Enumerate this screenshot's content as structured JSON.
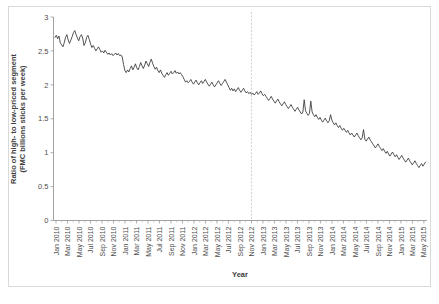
{
  "chart_data": {
    "type": "line",
    "title": "",
    "xlabel": "Year",
    "ylabel": "Ratio of high- to low-priced segment (FMC billions sticks per week)",
    "ylim": [
      0,
      3
    ],
    "yticks": [
      0,
      0.5,
      1,
      1.5,
      2,
      2.5,
      3
    ],
    "ytick_labels": [
      "0",
      "0.5",
      "1",
      "1.5",
      "2",
      "2.5",
      "3"
    ],
    "grid": false,
    "legend": "none",
    "line_color": "#3f3f3f",
    "annotation_line_color": "#c8c8c8",
    "annotation_vline_x": "Nov 2012",
    "xtick_labels": [
      "Jan 2010",
      "Mar 2010",
      "May 2010",
      "Jul 2010",
      "Sep 2010",
      "Nov 2010",
      "Jan 2011",
      "Mar 2011",
      "May 2011",
      "Jul 2011",
      "Sep 2011",
      "Nov 2011",
      "Jan 2012",
      "Mar 2012",
      "May 2012",
      "Jul 2012",
      "Sep 2012",
      "Nov 2012",
      "Jan 2013",
      "Mar 2013",
      "May 2013",
      "Jul 2013",
      "Sep 2013",
      "Nov 2013",
      "Jan 2014",
      "Mar 2014",
      "May 2014",
      "Jul 2014",
      "Sep 2014",
      "Nov 2014",
      "Jan 2015",
      "Mar 2015",
      "May 2015"
    ],
    "x_start": "Jan 2010",
    "x_end": "May 2015",
    "x_unit": "week",
    "n_points": 282,
    "values": [
      2.7,
      2.73,
      2.68,
      2.72,
      2.62,
      2.59,
      2.56,
      2.62,
      2.7,
      2.74,
      2.66,
      2.61,
      2.66,
      2.71,
      2.77,
      2.8,
      2.74,
      2.69,
      2.65,
      2.71,
      2.74,
      2.69,
      2.58,
      2.62,
      2.7,
      2.73,
      2.67,
      2.6,
      2.55,
      2.58,
      2.54,
      2.5,
      2.53,
      2.56,
      2.52,
      2.48,
      2.5,
      2.47,
      2.51,
      2.48,
      2.45,
      2.47,
      2.44,
      2.46,
      2.43,
      2.45,
      2.47,
      2.44,
      2.46,
      2.43,
      2.44,
      2.41,
      2.3,
      2.21,
      2.18,
      2.22,
      2.19,
      2.24,
      2.28,
      2.22,
      2.26,
      2.31,
      2.25,
      2.22,
      2.27,
      2.33,
      2.28,
      2.24,
      2.29,
      2.35,
      2.31,
      2.27,
      2.33,
      2.38,
      2.32,
      2.27,
      2.23,
      2.26,
      2.21,
      2.18,
      2.22,
      2.17,
      2.14,
      2.11,
      2.15,
      2.18,
      2.14,
      2.17,
      2.2,
      2.16,
      2.18,
      2.21,
      2.17,
      2.19,
      2.16,
      2.18,
      2.15,
      2.12,
      2.08,
      2.04,
      2.06,
      2.03,
      2.05,
      2.08,
      2.04,
      2.01,
      2.04,
      2.07,
      2.03,
      2.0,
      2.03,
      2.06,
      2.02,
      2.05,
      2.08,
      2.04,
      2.01,
      1.98,
      2.01,
      2.04,
      2.0,
      1.97,
      2.0,
      2.03,
      2.06,
      2.02,
      1.99,
      2.02,
      2.05,
      2.08,
      2.04,
      2.0,
      1.96,
      1.92,
      1.95,
      1.91,
      1.94,
      1.9,
      1.93,
      1.96,
      1.92,
      1.89,
      1.92,
      1.95,
      1.91,
      1.88,
      1.9,
      1.87,
      1.89,
      1.86,
      1.88,
      1.85,
      1.87,
      1.9,
      1.86,
      1.88,
      1.91,
      1.87,
      1.84,
      1.86,
      1.83,
      1.8,
      1.77,
      1.8,
      1.83,
      1.79,
      1.76,
      1.73,
      1.76,
      1.79,
      1.75,
      1.72,
      1.69,
      1.72,
      1.75,
      1.71,
      1.68,
      1.65,
      1.68,
      1.71,
      1.67,
      1.64,
      1.61,
      1.64,
      1.67,
      1.63,
      1.6,
      1.57,
      1.6,
      1.78,
      1.62,
      1.58,
      1.55,
      1.58,
      1.76,
      1.6,
      1.56,
      1.53,
      1.56,
      1.52,
      1.49,
      1.52,
      1.48,
      1.45,
      1.48,
      1.51,
      1.47,
      1.44,
      1.47,
      1.56,
      1.48,
      1.44,
      1.41,
      1.44,
      1.4,
      1.37,
      1.4,
      1.36,
      1.33,
      1.36,
      1.33,
      1.3,
      1.33,
      1.29,
      1.26,
      1.29,
      1.26,
      1.23,
      1.26,
      1.29,
      1.25,
      1.22,
      1.19,
      1.22,
      1.34,
      1.2,
      1.17,
      1.2,
      1.23,
      1.19,
      1.16,
      1.13,
      1.1,
      1.07,
      1.1,
      1.13,
      1.09,
      1.06,
      1.03,
      1.06,
      1.02,
      0.99,
      1.02,
      0.98,
      0.95,
      0.98,
      1.01,
      0.97,
      0.94,
      0.97,
      0.93,
      0.9,
      0.93,
      0.96,
      0.92,
      0.89,
      0.86,
      0.89,
      0.92,
      0.88,
      0.85,
      0.82,
      0.85,
      0.88,
      0.84,
      0.81,
      0.78,
      0.81,
      0.84,
      0.8,
      0.83,
      0.86
    ]
  }
}
